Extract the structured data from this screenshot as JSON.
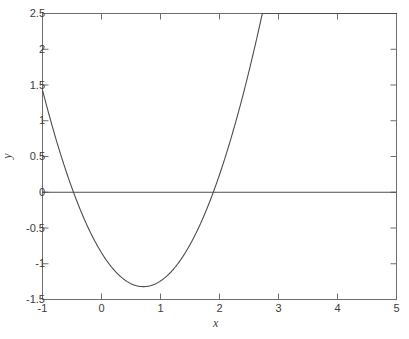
{
  "chart_data": {
    "type": "line",
    "title": "",
    "xlabel": "x",
    "ylabel": "y",
    "xlim": [
      -1,
      5
    ],
    "ylim": [
      -1.5,
      2.5
    ],
    "xticks": [
      -1,
      0,
      1,
      2,
      3,
      4,
      5
    ],
    "xticklabels": [
      "-1",
      "0",
      "1",
      "2",
      "3",
      "4",
      "5"
    ],
    "yticks": [
      -1.5,
      -1,
      -0.5,
      0,
      0.5,
      1,
      1.5,
      2,
      2.5
    ],
    "yticklabels": [
      "-1.5",
      "-1",
      "-0.5",
      "0",
      "0.5",
      "1",
      "1.5",
      "2",
      "2.5"
    ],
    "grid": false,
    "legend": null,
    "box": true,
    "tick_direction": "in",
    "line_color": "#4d4d4d",
    "axis_color": "#6e6e6e",
    "background": "#ffffff",
    "series": [
      {
        "name": "curve",
        "description": "quadratic y = 0.6*x^2 - 0.85*x - 1.02",
        "style": "solid",
        "x": [
          -1,
          -0.75,
          -0.5,
          -0.25,
          0,
          0.25,
          0.5,
          0.75,
          1,
          1.25,
          1.5,
          1.75,
          2,
          2.25,
          2.5,
          2.75,
          3,
          3.25,
          3.5,
          3.75,
          4,
          4.25,
          4.5,
          4.75,
          5
        ],
        "y": [
          1.43,
          0.95,
          0.55,
          0.23,
          -1.02,
          -1.19,
          -1.29,
          -1.32,
          -1.27,
          -1.15,
          -0.95,
          -0.68,
          -0.32,
          0.11,
          0.61,
          1.19,
          1.84,
          2.57,
          3.37,
          4.22,
          5.18,
          6.16,
          7.22,
          8.36,
          9.57
        ],
        "y_endpoint_left": 1.43,
        "y_endpoint_right": 1.93,
        "minimum": {
          "x": 0.71,
          "y": -1.32
        },
        "zeros": [
          -0.57,
          2.98
        ]
      },
      {
        "name": "zero-line",
        "description": "horizontal reference line at y = 0",
        "style": "solid",
        "x": [
          -1,
          5
        ],
        "y": [
          0,
          0
        ]
      }
    ]
  }
}
